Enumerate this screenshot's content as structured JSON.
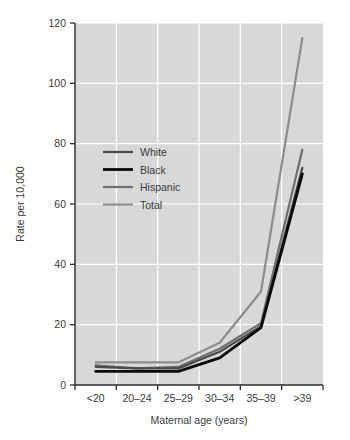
{
  "chart_data": {
    "type": "line",
    "title": "",
    "subtitle": "",
    "xlabel": "Maternal age (years)",
    "ylabel": "Rate per 10,000",
    "categories": [
      "<20",
      "20–24",
      "25–29",
      "30–34",
      "35–39",
      ">39"
    ],
    "xtick_labels": [
      "<20",
      "20–24",
      "25–29",
      "30–34",
      "35–39",
      ">39"
    ],
    "ytick_labels": [
      "0",
      "20",
      "40",
      "60",
      "80",
      "100",
      "120"
    ],
    "ytick_values": [
      0,
      20,
      40,
      60,
      80,
      100,
      120
    ],
    "ylim": [
      0,
      120
    ],
    "grid": true,
    "grid_color": "#ffffff",
    "plot_background": "#d8d8d8",
    "figure_background": "#ffffff",
    "axis_color": "#2b2b2b",
    "legend_position": "upper-left-inside",
    "series": [
      {
        "name": "White",
        "color": "#4a4a4a",
        "width": 2.2,
        "values": [
          6,
          5.5,
          5.5,
          11,
          19.5,
          72
        ]
      },
      {
        "name": "Black",
        "color": "#0a0a0a",
        "width": 2.8,
        "values": [
          4.5,
          4.5,
          4.5,
          9,
          19,
          70
        ]
      },
      {
        "name": "Hispanic",
        "color": "#6e6e6e",
        "width": 2.2,
        "values": [
          6.5,
          5.5,
          6,
          12,
          20.5,
          78
        ]
      },
      {
        "name": "Total",
        "color": "#8c8c8c",
        "width": 2.2,
        "values": [
          7.5,
          7.5,
          7.5,
          14,
          31,
          115
        ]
      }
    ]
  },
  "legend": {
    "entries": [
      {
        "label": "White"
      },
      {
        "label": "Black"
      },
      {
        "label": "Hispanic"
      },
      {
        "label": "Total"
      }
    ]
  }
}
